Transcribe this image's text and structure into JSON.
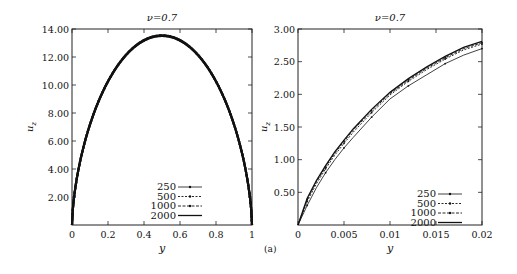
{
  "figure": {
    "caption": "(a)"
  },
  "chart_data": [
    {
      "type": "line",
      "title": "ν=0.7",
      "xlabel": "y",
      "ylabel": "u_z",
      "xlim": [
        0,
        1
      ],
      "ylim": [
        0,
        14
      ],
      "x_ticks": [
        "0",
        "0.2",
        "0.4",
        "0.6",
        "0.8",
        "1"
      ],
      "y_ticks": [
        "2.00",
        "4.00",
        "6.00",
        "8.00",
        "10.00",
        "12.00",
        "14.00"
      ],
      "grid": false,
      "legend_position": "lower center",
      "legend": [
        "250",
        "500",
        "1000",
        "2000"
      ],
      "x": [
        0,
        0.005,
        0.01,
        0.02,
        0.05,
        0.1,
        0.15,
        0.2,
        0.3,
        0.4,
        0.5,
        0.6,
        0.7,
        0.8,
        0.85,
        0.9,
        0.95,
        0.98,
        0.99,
        0.995,
        1
      ],
      "series": [
        {
          "name": "250",
          "values": [
            0,
            0.48,
            0.97,
            1.9,
            4.1,
            6.8,
            8.7,
            10.1,
            12.0,
            13.1,
            13.5,
            13.1,
            12.0,
            10.1,
            8.7,
            6.8,
            4.1,
            1.9,
            0.97,
            0.48,
            0
          ]
        },
        {
          "name": "500",
          "values": [
            0,
            0.49,
            0.98,
            1.92,
            4.12,
            6.82,
            8.72,
            10.12,
            12.02,
            13.12,
            13.52,
            13.12,
            12.02,
            10.12,
            8.72,
            6.82,
            4.12,
            1.92,
            0.98,
            0.49,
            0
          ]
        },
        {
          "name": "1000",
          "values": [
            0,
            0.5,
            0.99,
            1.94,
            4.14,
            6.84,
            8.74,
            10.14,
            12.04,
            13.14,
            13.54,
            13.14,
            12.04,
            10.14,
            8.74,
            6.84,
            4.14,
            1.94,
            0.99,
            0.5,
            0
          ]
        },
        {
          "name": "2000",
          "values": [
            0,
            0.5,
            1.0,
            1.95,
            4.15,
            6.85,
            8.75,
            10.15,
            12.05,
            13.15,
            13.55,
            13.15,
            12.05,
            10.15,
            8.75,
            6.85,
            4.15,
            1.95,
            1.0,
            0.5,
            0
          ]
        }
      ]
    },
    {
      "type": "line",
      "title": "ν=0.7",
      "xlabel": "y",
      "ylabel": "u_z",
      "xlim": [
        0,
        0.02
      ],
      "ylim": [
        0,
        3
      ],
      "x_ticks": [
        "0",
        "0.005",
        "0.01",
        "0.015",
        "0.02"
      ],
      "y_ticks": [
        "0.50",
        "1.00",
        "1.50",
        "2.00",
        "2.50",
        "3.00"
      ],
      "grid": false,
      "legend_position": "lower right",
      "legend": [
        "250",
        "500",
        "1000",
        "2000"
      ],
      "x": [
        0,
        0.001,
        0.002,
        0.003,
        0.004,
        0.005,
        0.006,
        0.008,
        0.01,
        0.012,
        0.014,
        0.016,
        0.018,
        0.02
      ],
      "series": [
        {
          "name": "250",
          "values": [
            0,
            0.3,
            0.57,
            0.8,
            1.0,
            1.18,
            1.34,
            1.65,
            1.93,
            2.13,
            2.3,
            2.47,
            2.6,
            2.7
          ]
        },
        {
          "name": "500",
          "values": [
            0,
            0.36,
            0.63,
            0.86,
            1.07,
            1.25,
            1.42,
            1.72,
            1.99,
            2.2,
            2.38,
            2.54,
            2.68,
            2.77
          ]
        },
        {
          "name": "1000",
          "values": [
            0,
            0.39,
            0.66,
            0.89,
            1.1,
            1.28,
            1.45,
            1.75,
            2.01,
            2.22,
            2.4,
            2.56,
            2.7,
            2.79
          ]
        },
        {
          "name": "2000",
          "values": [
            0,
            0.41,
            0.68,
            0.91,
            1.12,
            1.3,
            1.47,
            1.77,
            2.03,
            2.24,
            2.42,
            2.58,
            2.72,
            2.81
          ]
        }
      ]
    }
  ]
}
